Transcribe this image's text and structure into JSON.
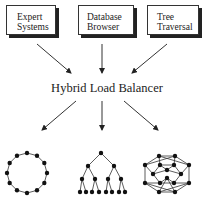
{
  "sources": [
    {
      "line1": "Expert",
      "line2": "Systems"
    },
    {
      "line1": "Database",
      "line2": "Browser"
    },
    {
      "line1": "Tree",
      "line2": "Traversal"
    }
  ],
  "center_label": "Hybrid Load Balancer",
  "topologies": [
    "ring",
    "tree",
    "hypercube"
  ],
  "colors": {
    "line": "#333333",
    "node": "#111111"
  }
}
